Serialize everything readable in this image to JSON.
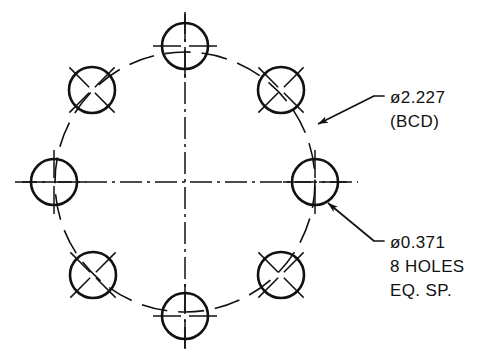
{
  "drawing": {
    "title": "Bolt Circle Hole Pattern Detail",
    "type": "engineering-drawing",
    "background_color": "#ffffff",
    "line_color": "#111111",
    "geometry": {
      "center_x": 185,
      "center_y": 182,
      "bolt_circle_radius_px": 130,
      "hole_radius_px": 23,
      "hole_count": 8,
      "hole_angles_deg": [
        0,
        45,
        90,
        135,
        180,
        225,
        270,
        315
      ]
    },
    "holes": [
      {
        "id": "hole-right",
        "name": "hole-0-deg",
        "cx": 315,
        "cy": 182,
        "r": 23,
        "tick_style": "cross"
      },
      {
        "id": "hole-upper-right",
        "name": "hole-45-deg",
        "cx": 281,
        "cy": 90,
        "r": 23,
        "tick_style": "diagonal"
      },
      {
        "id": "hole-top",
        "name": "hole-90-deg",
        "cx": 185,
        "cy": 46,
        "r": 23,
        "tick_style": "cross"
      },
      {
        "id": "hole-upper-left",
        "name": "hole-135-deg",
        "cx": 92,
        "cy": 90,
        "r": 23,
        "tick_style": "diagonal"
      },
      {
        "id": "hole-left",
        "name": "hole-180-deg",
        "cx": 54,
        "cy": 182,
        "r": 23,
        "tick_style": "cross"
      },
      {
        "id": "hole-lower-left",
        "name": "hole-225-deg",
        "cx": 93,
        "cy": 275,
        "r": 23,
        "tick_style": "diagonal"
      },
      {
        "id": "hole-bottom",
        "name": "hole-270-deg",
        "cx": 185,
        "cy": 316,
        "r": 23,
        "tick_style": "cross"
      },
      {
        "id": "hole-lower-right",
        "name": "hole-315-deg",
        "cx": 281,
        "cy": 275,
        "r": 23,
        "tick_style": "diagonal"
      }
    ],
    "centerlines": {
      "horizontal": {
        "x1": 15,
        "y1": 182,
        "x2": 358,
        "y2": 182
      },
      "vertical": {
        "x1": 185,
        "y1": 12,
        "x2": 185,
        "y2": 350
      }
    },
    "annotations": [
      {
        "id": "bcd-note",
        "name": "bcd-dimension-note",
        "lines": [
          "ø2.227",
          "(BCD)"
        ],
        "text_x": 390,
        "text_y": 103,
        "line_height": 24,
        "leader": {
          "elbow_x": 384,
          "elbow_y": 96,
          "shoulder_x": 374,
          "shoulder_y": 96,
          "tip_x": 318,
          "tip_y": 124
        }
      },
      {
        "id": "hole-size-note",
        "name": "hole-size-note",
        "lines": [
          "ø0.371",
          "8  HOLES",
          "EQ. SP."
        ],
        "text_x": 390,
        "text_y": 248,
        "line_height": 24,
        "leader": {
          "elbow_x": 384,
          "elbow_y": 241,
          "shoulder_x": 374,
          "shoulder_y": 241,
          "tip_x": 328,
          "tip_y": 203
        }
      }
    ]
  },
  "chart_data": {
    "type": "diagram",
    "bolt_circle_diameter": 2.227,
    "bolt_circle_label": "ø2.227 (BCD)",
    "hole_diameter": 0.371,
    "hole_label": "ø0.371 8 HOLES EQ. SP.",
    "hole_count": 8,
    "angular_spacing_deg": 45,
    "units": "inches",
    "annotations": [
      "ø2.227",
      "(BCD)",
      "ø0.371",
      "8  HOLES",
      "EQ. SP."
    ]
  }
}
